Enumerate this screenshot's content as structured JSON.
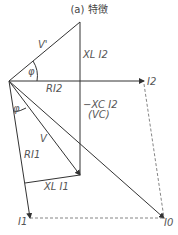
{
  "title": "(a) 特徴",
  "labels": {
    "v_prime": "V'",
    "phi_top": "φ",
    "xl_i2": "XL I2",
    "ri2": "RI2",
    "i2": "I2",
    "neg_xc_i2": "−XC I2",
    "vc": "(VC)",
    "phi_bottom": "φ",
    "v": "V",
    "ri1": "RI1",
    "xl_i1": "XL I1",
    "i1": "I1",
    "i0": "I0"
  }
}
